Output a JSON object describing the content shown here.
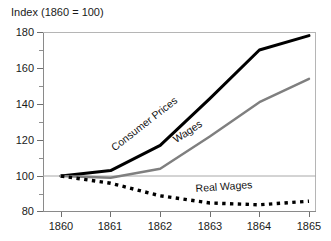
{
  "chart_data": {
    "type": "line",
    "title": "Index (1860 = 100)",
    "xlabel": "",
    "ylabel": "",
    "x": [
      1860,
      1861,
      1862,
      1863,
      1864,
      1865
    ],
    "xlim": [
      1860,
      1865
    ],
    "ylim": [
      80,
      180
    ],
    "yticks": [
      80,
      100,
      120,
      140,
      160,
      180
    ],
    "yticks_minor": [
      90,
      110,
      130,
      150,
      170
    ],
    "xticks": [
      1860,
      1861,
      1862,
      1863,
      1864,
      1865
    ],
    "grid": "single horizontal reference line at 100",
    "reference_line": 100,
    "legend": "inline labels along each curve",
    "series": [
      {
        "name": "Consumer Prices",
        "color": "#000000",
        "style": "solid",
        "width": 3,
        "values": [
          100,
          103,
          117,
          143,
          170,
          178
        ]
      },
      {
        "name": "Wages",
        "color": "#7f7f7f",
        "style": "solid",
        "width": 2.4,
        "values": [
          100,
          99,
          104,
          122,
          141,
          154
        ]
      },
      {
        "name": "Real Wages",
        "color": "#000000",
        "style": "dotted",
        "width": 3.4,
        "values": [
          100,
          96,
          89,
          85,
          84,
          86
        ]
      }
    ]
  },
  "axis": {
    "title": "Index (1860 = 100)",
    "y_labels": [
      "180",
      "160",
      "140",
      "120",
      "100",
      "80"
    ],
    "x_labels": [
      "1860",
      "1861",
      "1862",
      "1863",
      "1864",
      "1865"
    ]
  },
  "labels": {
    "consumer_prices": "Consumer Prices",
    "wages": "Wages",
    "real_wages": "Real Wages"
  },
  "colors": {
    "consumer_prices": "#000000",
    "wages": "#7f7f7f",
    "real_wages": "#000000",
    "axis": "#888888",
    "text": "#1a1a1a"
  }
}
